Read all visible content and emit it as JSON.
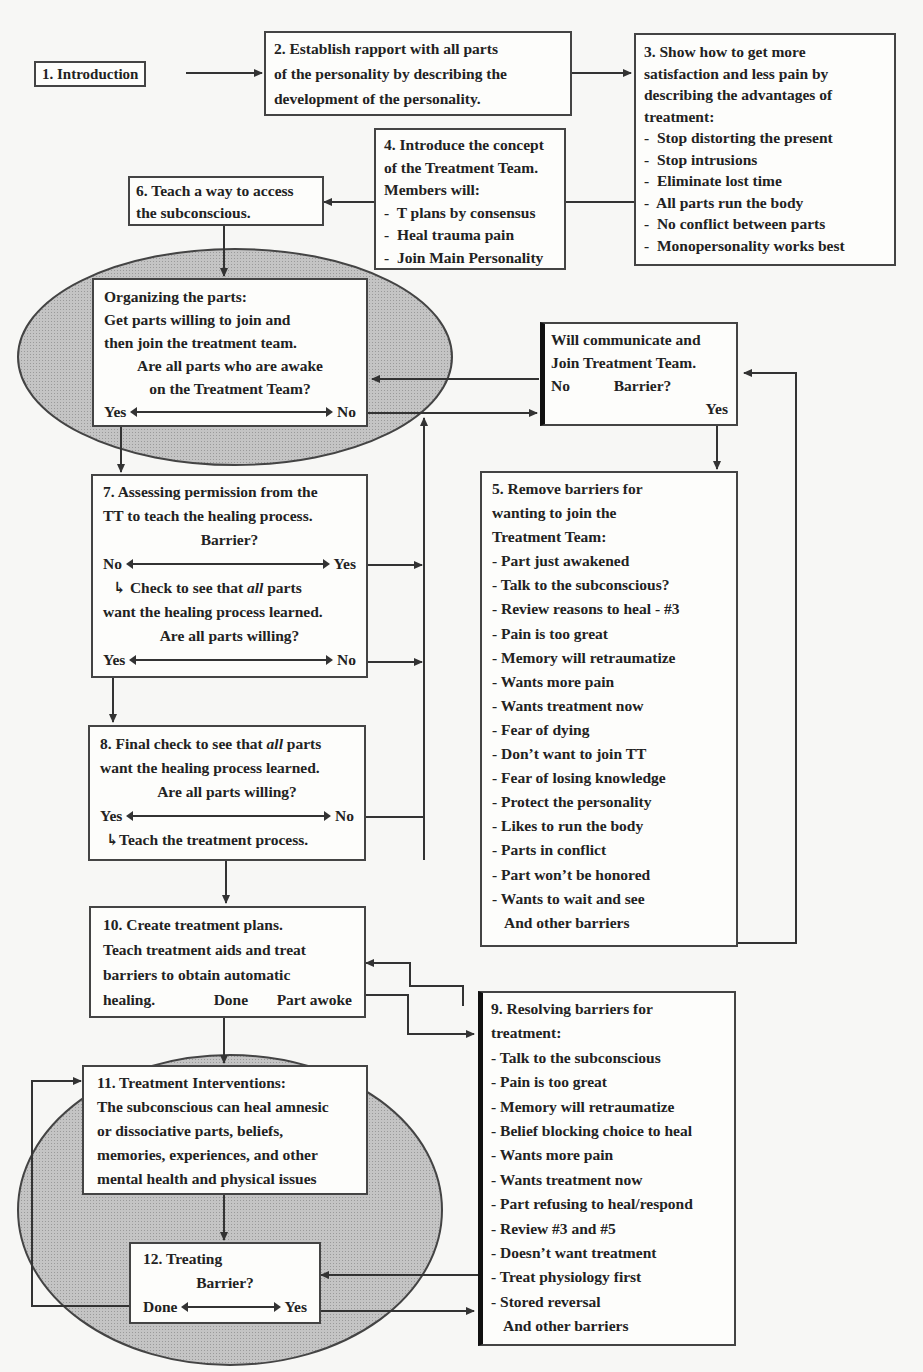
{
  "diagram": {
    "type": "flowchart",
    "colors": {
      "background": "#f7f7f5",
      "box_fill": "#fdfdfb",
      "box_border": "#444444",
      "ellipse_fill": "#bdbdbd",
      "line": "#333333",
      "text": "#222222"
    },
    "nodes": {
      "n1": {
        "lines": [
          "1. Introduction"
        ]
      },
      "n2": {
        "lines": [
          "2. Establish rapport with all parts",
          "of the personality by describing the",
          "development of the personality."
        ]
      },
      "n3": {
        "lines": [
          "3. Show how to get more",
          "satisfaction and less pain by",
          "describing the advantages of",
          "treatment:"
        ],
        "items": [
          "Stop distorting the present",
          "Stop intrusions",
          "Eliminate lost time",
          "All parts run the body",
          "No conflict between parts",
          "Monopersonality works best"
        ]
      },
      "n4": {
        "lines": [
          "4. Introduce the concept",
          "of the Treatment Team.",
          "Members will:"
        ],
        "items": [
          "T plans by consensus",
          "Heal trauma pain",
          "Join Main Personality"
        ]
      },
      "n6": {
        "lines": [
          "6.  Teach a way to access",
          "the subconscious."
        ]
      },
      "organize": {
        "lines": [
          "Organizing the parts:",
          "Get parts willing to join and",
          "then join the treatment team."
        ],
        "question": [
          "Are all parts who are awake",
          "on the Treatment Team?"
        ],
        "left": "Yes",
        "right": "No"
      },
      "communicate": {
        "lines": [
          "Will communicate and",
          "Join Treatment Team."
        ],
        "left": "No",
        "question": "Barrier?",
        "right": "Yes"
      },
      "n7": {
        "lines": [
          "7. Assessing permission from the",
          "TT to teach the healing process."
        ],
        "question1": "Barrier?",
        "left1": "No",
        "right1": "Yes",
        "check_pre": "Check to see that ",
        "check_em": "all",
        "check_post": " parts",
        "check_line2": "want the healing process learned.",
        "question2": "Are all parts willing?",
        "left2": "Yes",
        "right2": "No"
      },
      "n5": {
        "lines": [
          "5. Remove barriers for",
          "wanting to join the",
          "Treatment Team:"
        ],
        "items": [
          "Part just awakened",
          "Talk to the subconscious?",
          "Review reasons to heal - #3",
          "Pain is too great",
          "Memory will retraumatize",
          "Wants more pain",
          "Wants treatment now",
          "Fear of dying",
          "Don’t want to join TT",
          "Fear of losing knowledge",
          "Protect the personality",
          "Likes to run the body",
          "Parts in conflict",
          "Part won’t be honored",
          "Wants to wait and see"
        ],
        "footer": "And other barriers"
      },
      "n8": {
        "line1_pre": "8. Final check to see that ",
        "line1_em": "all",
        "line1_post": " parts",
        "line2": "want the healing process learned.",
        "question": "Are all parts willing?",
        "left": "Yes",
        "right": "No",
        "result": "Teach the treatment process."
      },
      "n10": {
        "lines": [
          "10. Create treatment plans.",
          "Teach treatment aids and treat",
          "barriers to obtain automatic"
        ],
        "last": "healing.",
        "done": "Done",
        "part_awoke": "Part awoke"
      },
      "n9": {
        "lines": [
          "9. Resolving barriers for",
          "treatment:"
        ],
        "items": [
          "Talk to the subconscious",
          "Pain is too great",
          "Memory will retraumatize",
          "Belief blocking choice to heal",
          "Wants more pain",
          "Wants treatment now",
          "Part refusing to heal/respond",
          "Review #3 and #5",
          "Doesn’t want treatment",
          "Treat physiology first",
          "Stored reversal"
        ],
        "footer": "And other barriers"
      },
      "n11": {
        "lines": [
          "11. Treatment Interventions:",
          "The subconscious can heal amnesic",
          "or dissociative parts, beliefs,",
          "memories, experiences, and other",
          "mental health and physical issues"
        ]
      },
      "n12": {
        "lines": [
          "12. Treating"
        ],
        "question": "Barrier?",
        "left": "Done",
        "right": "Yes"
      }
    }
  }
}
